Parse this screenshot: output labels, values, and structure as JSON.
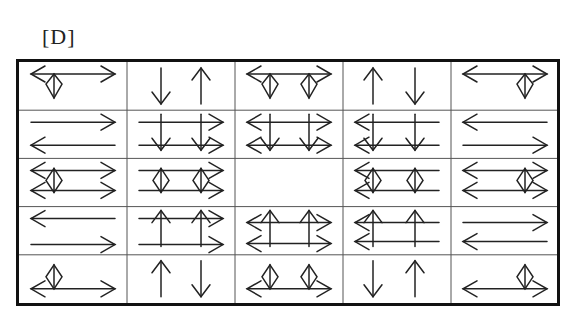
{
  "label": "[D]",
  "grid": {
    "rows": 5,
    "cols": 5,
    "cell_width": 108,
    "cell_height": 48.2,
    "line_color": "#555555",
    "stroke_color": "#222222",
    "cells": [
      [
        {
          "desc": "double-headed horizontal arrow with one diamond near left",
          "hlines": [
            {
              "y": 12,
              "left": "head",
              "right": "head"
            }
          ],
          "diamonds": [
            {
              "x": 35,
              "y": 12
            }
          ]
        },
        {
          "desc": "down arrow then up arrow",
          "varrows": [
            {
              "x": 34,
              "dir": "down"
            },
            {
              "x": 74,
              "dir": "up"
            }
          ]
        },
        {
          "desc": "double-headed horizontal arrow with two diamonds",
          "hlines": [
            {
              "y": 12,
              "left": "head",
              "right": "head"
            }
          ],
          "diamonds": [
            {
              "x": 35,
              "y": 12
            },
            {
              "x": 74,
              "y": 12
            }
          ]
        },
        {
          "desc": "up arrow then down arrow",
          "varrows": [
            {
              "x": 30,
              "dir": "up"
            },
            {
              "x": 72,
              "dir": "down"
            }
          ]
        },
        {
          "desc": "double-headed horizontal arrow with one diamond near right",
          "hlines": [
            {
              "y": 12,
              "left": "head",
              "right": "head"
            }
          ],
          "diamonds": [
            {
              "x": 74,
              "y": 12
            }
          ]
        }
      ],
      [
        {
          "desc": "right arrow above, left arrow below",
          "hlines": [
            {
              "y": 12,
              "left": "none",
              "right": "head"
            },
            {
              "y": 35,
              "left": "head",
              "right": "none"
            }
          ]
        },
        {
          "desc": "two right arrows crossed by two down arrows",
          "hlines": [
            {
              "y": 12,
              "left": "none",
              "right": "head"
            },
            {
              "y": 35,
              "left": "none",
              "right": "head"
            }
          ],
          "varrows": [
            {
              "x": 34,
              "dir": "down",
              "span": true
            },
            {
              "x": 74,
              "dir": "down",
              "span": true
            }
          ]
        },
        {
          "desc": "two double-headed arrows crossed by two down arrows",
          "hlines": [
            {
              "y": 12,
              "left": "head",
              "right": "head"
            },
            {
              "y": 35,
              "left": "head",
              "right": "head"
            }
          ],
          "varrows": [
            {
              "x": 35,
              "dir": "down",
              "span": true
            },
            {
              "x": 74,
              "dir": "down",
              "span": true
            }
          ]
        },
        {
          "desc": "two left arrows crossed by two down arrows",
          "hlines": [
            {
              "y": 12,
              "left": "head",
              "right": "none"
            },
            {
              "y": 35,
              "left": "head",
              "right": "none"
            }
          ],
          "varrows": [
            {
              "x": 30,
              "dir": "down",
              "span": true
            },
            {
              "x": 72,
              "dir": "down",
              "span": true
            }
          ]
        },
        {
          "desc": "left arrow above, right arrow below",
          "hlines": [
            {
              "y": 12,
              "left": "head",
              "right": "none"
            },
            {
              "y": 35,
              "left": "none",
              "right": "head"
            }
          ]
        }
      ],
      [
        {
          "desc": "two double-headed arrows with one diamond near left",
          "hlines": [
            {
              "y": 12,
              "left": "head",
              "right": "head"
            },
            {
              "y": 32,
              "left": "head",
              "right": "head"
            }
          ],
          "diamonds": [
            {
              "x": 35,
              "y": 22,
              "tall": true
            }
          ]
        },
        {
          "desc": "two plain lines with two diamonds, right heads",
          "hlines": [
            {
              "y": 12,
              "left": "none",
              "right": "head"
            },
            {
              "y": 32,
              "left": "none",
              "right": "head"
            }
          ],
          "diamonds": [
            {
              "x": 34,
              "y": 22,
              "tall": true
            },
            {
              "x": 74,
              "y": 22,
              "tall": true
            }
          ]
        },
        {
          "desc": "empty cell",
          "empty": true
        },
        {
          "desc": "two left arrows with two diamonds",
          "hlines": [
            {
              "y": 12,
              "left": "head",
              "right": "none"
            },
            {
              "y": 32,
              "left": "head",
              "right": "none"
            }
          ],
          "diamonds": [
            {
              "x": 30,
              "y": 22,
              "tall": true
            },
            {
              "x": 72,
              "y": 22,
              "tall": true
            }
          ]
        },
        {
          "desc": "two double-headed arrows with one diamond near right",
          "hlines": [
            {
              "y": 12,
              "left": "head",
              "right": "head"
            },
            {
              "y": 32,
              "left": "head",
              "right": "head"
            }
          ],
          "diamonds": [
            {
              "x": 74,
              "y": 22,
              "tall": true
            }
          ]
        }
      ],
      [
        {
          "desc": "left arrow above, right arrow below",
          "hlines": [
            {
              "y": 12,
              "left": "head",
              "right": "none"
            },
            {
              "y": 38,
              "left": "none",
              "right": "head"
            }
          ]
        },
        {
          "desc": "two right arrows crossed by two up arrows",
          "hlines": [
            {
              "y": 12,
              "left": "none",
              "right": "head"
            },
            {
              "y": 38,
              "left": "none",
              "right": "head"
            }
          ],
          "varrows": [
            {
              "x": 34,
              "dir": "up",
              "span": true
            },
            {
              "x": 74,
              "dir": "up",
              "span": true
            }
          ]
        },
        {
          "desc": "two double-headed arrows crossed by two up arrows",
          "hlines": [
            {
              "y": 16,
              "left": "head",
              "right": "head"
            },
            {
              "y": 37,
              "left": "head",
              "right": "head"
            }
          ],
          "varrows": [
            {
              "x": 35,
              "dir": "up",
              "span": true
            },
            {
              "x": 74,
              "dir": "up",
              "span": true
            }
          ]
        },
        {
          "desc": "two left arrows crossed by two up arrows",
          "hlines": [
            {
              "y": 16,
              "left": "head",
              "right": "none"
            },
            {
              "y": 35,
              "left": "head",
              "right": "none"
            }
          ],
          "varrows": [
            {
              "x": 30,
              "dir": "up",
              "span": true
            },
            {
              "x": 72,
              "dir": "up",
              "span": true
            }
          ]
        },
        {
          "desc": "right arrow above, left arrow below",
          "hlines": [
            {
              "y": 16,
              "left": "none",
              "right": "head"
            },
            {
              "y": 35,
              "left": "head",
              "right": "none"
            }
          ]
        }
      ],
      [
        {
          "desc": "double-headed horizontal arrow with one diamond near left",
          "hlines": [
            {
              "y": 34,
              "left": "head",
              "right": "head"
            }
          ],
          "diamonds": [
            {
              "x": 35,
              "y": 34,
              "up": true
            }
          ]
        },
        {
          "desc": "up arrow then down arrow",
          "varrows": [
            {
              "x": 34,
              "dir": "up"
            },
            {
              "x": 74,
              "dir": "down"
            }
          ]
        },
        {
          "desc": "double-headed horizontal arrow with two diamonds",
          "hlines": [
            {
              "y": 34,
              "left": "head",
              "right": "head"
            }
          ],
          "diamonds": [
            {
              "x": 35,
              "y": 34,
              "up": true
            },
            {
              "x": 74,
              "y": 34,
              "up": true
            }
          ]
        },
        {
          "desc": "down arrow then up arrow",
          "varrows": [
            {
              "x": 30,
              "dir": "down"
            },
            {
              "x": 72,
              "dir": "up"
            }
          ]
        },
        {
          "desc": "double-headed horizontal arrow with one diamond near right",
          "hlines": [
            {
              "y": 34,
              "left": "head",
              "right": "head"
            }
          ],
          "diamonds": [
            {
              "x": 74,
              "y": 34,
              "up": true
            }
          ]
        }
      ]
    ]
  }
}
